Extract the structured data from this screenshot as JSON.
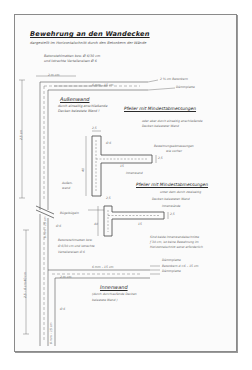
{
  "document": {
    "title": "Bewehrung an den Wandecken",
    "subtitle": "dargestellt im Horizontalschnitt durch den Betonkern der Wände",
    "top_note": {
      "line1": "Betonstahlmatten bzw. Ø 6/30 cm",
      "line2": "und lotrechte Verteilereisen Ø 6"
    },
    "dimensions": {
      "top_width": "2 m cm",
      "top_inner": "6 mm – 15 cm",
      "left_upper": "2,5 cm",
      "left_middle": "6 mm – 15 cm",
      "left_lower": "2,5 – 6 cm 40 cm",
      "left_bottom": "6 mm – 15 cm",
      "bottom_inner": "6 mm – 15 cm",
      "inner_top": "2 m cm",
      "pillar1_width": "2,5",
      "pillar1_height": "40",
      "pillar1_arm": "15",
      "pillar2_width": "2,5",
      "pillar2_height": "40",
      "pillar2_arm": "15",
      "rebar_label": "Ø 6",
      "rebar_label_2": "Ø 6",
      "rebar_label_3": "Ø 6",
      "rebar_label_4": "Ø 6",
      "gap_side_1": "2,5",
      "gap_side_2": "2,5"
    },
    "right_notes": {
      "top_1": "2 ½ cm Betonkern",
      "top_2": "Dämmplatte",
      "bottom_1": "Dämmplatte",
      "bottom_2": "Betonkern d.=6 – 15 cm",
      "bottom_3": "Dämmplatte"
    },
    "outer_wall": {
      "heading": "Außenwand",
      "line1": "durch einseitig anschließende",
      "line2": "Decken belastete Wand !"
    },
    "pillar_section_1": {
      "heading": "Pfeiler mit Mindestabmessungen",
      "line1": "oder aber durch einseitig anschließende",
      "line2": "Decken belasteter Wand",
      "rebar_note_1": "Bewehrungsabmessungen",
      "rebar_note_2": "wie vorher",
      "inner_wall_label": "Innenwand"
    },
    "outer_wall_small": {
      "line1": "Außen-",
      "line2": "wand"
    },
    "pillar_section_2": {
      "heading": "Pfeiler mit Mindestabmessungen",
      "line1": "unter dem durch zweiseitig",
      "line2": "Decken belasteten Wand",
      "inner_wall_label": "Innenwände",
      "stirrup_label": "Bügelbügeln",
      "note_1": "Sind beide Innenwandabschnitte",
      "note_2": "ƒ 30 cm, ist keine Bewehrung im",
      "note_3": "Horizontalschnitt sonst erforderlich"
    },
    "left_note": {
      "line1": "Betonstahlmatten bzw.",
      "line2": "Ø 6/30 cm und lotrechte",
      "line3": "Verteilereisen Ø 6"
    },
    "inner_wall": {
      "heading": "Innenwand",
      "line1": "(durch durchlaufende Decken",
      "line2": "belastete Wand )"
    }
  },
  "colors": {
    "paper": "#fbfbfb",
    "ink": "#3a3a3a",
    "frame": "#8a8a8a"
  }
}
